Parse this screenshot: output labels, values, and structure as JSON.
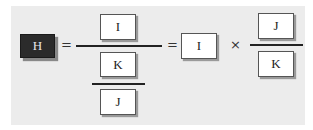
{
  "equation": {
    "lhs": "H",
    "equals_1": "=",
    "complex_fraction": {
      "numerator": "I",
      "denominator": {
        "numerator": "K",
        "denominator": "J"
      }
    },
    "equals_2": "=",
    "term": "I",
    "operator": "×",
    "fraction": {
      "numerator": "J",
      "denominator": "K"
    }
  },
  "colors": {
    "panel_background": "#ececec",
    "box_background": "#ffffff",
    "highlight_box": "#2b2b2b"
  }
}
